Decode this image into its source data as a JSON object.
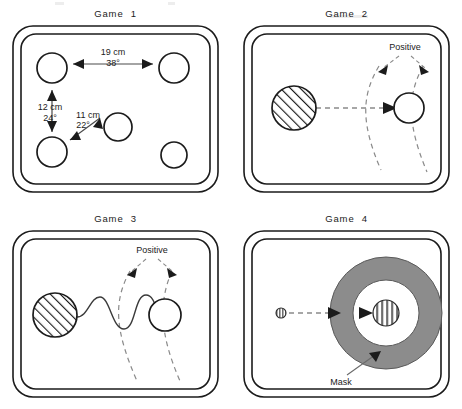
{
  "figure": {
    "name": "four-game-apparatus-diagram",
    "background_color": "#ffffff",
    "line_color": "#1b1b1b",
    "dashed_color": "#7a7a7a",
    "mask_fill_color": "#8c8c8c",
    "panel_count": 4
  },
  "panels": [
    {
      "id": "game-1",
      "title": "Game  1",
      "arena": {
        "shape": "double-rounded-rectangle",
        "outer_inset": 0,
        "inner_inset": 8
      },
      "targets": [
        {
          "name": "circle-top-left",
          "cx": 52,
          "cy": 68,
          "r": 15,
          "fill": "open"
        },
        {
          "name": "circle-top-right",
          "cx": 174,
          "cy": 68,
          "r": 15,
          "fill": "open"
        },
        {
          "name": "circle-bottom-left",
          "cx": 52,
          "cy": 152,
          "r": 15,
          "fill": "open"
        },
        {
          "name": "circle-bottom-right",
          "cx": 174,
          "cy": 155,
          "r": 13,
          "fill": "open"
        },
        {
          "name": "circle-center",
          "cx": 118,
          "cy": 127,
          "r": 14,
          "fill": "open"
        }
      ],
      "measurements": [
        {
          "name": "measure-top-horizontal",
          "distance": "19 cm",
          "angle": "38°"
        },
        {
          "name": "measure-left-vertical",
          "distance": "12 cm",
          "angle": "24°"
        },
        {
          "name": "measure-diagonal",
          "distance": "11 cm",
          "angle": "22°"
        }
      ]
    },
    {
      "id": "game-2",
      "title": "Game  2",
      "arena": {
        "shape": "double-rounded-rectangle",
        "outer_inset": 0,
        "inner_inset": 8
      },
      "stimulus": {
        "name": "hatched-disc",
        "cx": 63,
        "cy": 108,
        "r": 22,
        "fill": "diagonal-hatch"
      },
      "target": {
        "name": "open-circle",
        "cx": 178,
        "cy": 108,
        "r": 15,
        "fill": "open"
      },
      "path": {
        "name": "straight-dashed-path",
        "style": "dashed",
        "arrowhead": true
      },
      "arcs": {
        "name": "positive-boundary-arcs",
        "count": 2,
        "style": "dashed"
      },
      "label": {
        "name": "positive-label",
        "text": "Positive"
      }
    },
    {
      "id": "game-3",
      "title": "Game  3",
      "arena": {
        "shape": "double-rounded-rectangle",
        "outer_inset": 0,
        "inner_inset": 8
      },
      "stimulus": {
        "name": "hatched-disc",
        "cx": 55,
        "cy": 110,
        "r": 22,
        "fill": "diagonal-hatch"
      },
      "target": {
        "name": "open-circle",
        "cx": 165,
        "cy": 110,
        "r": 16,
        "fill": "open"
      },
      "path": {
        "name": "wavy-solid-path",
        "style": "solid",
        "oscillations": 2.5,
        "arrowhead": false
      },
      "arcs": {
        "name": "positive-boundary-arcs",
        "count": 2,
        "style": "dashed"
      },
      "label": {
        "name": "positive-label",
        "text": "Positive"
      }
    },
    {
      "id": "game-4",
      "title": "Game  4",
      "arena": {
        "shape": "double-rounded-rectangle",
        "outer_inset": 0,
        "inner_inset": 8
      },
      "stimulus": {
        "name": "small-striped-disc",
        "cx": 50,
        "cy": 108,
        "r": 5,
        "fill": "vertical-stripes"
      },
      "target": {
        "name": "center-striped-disc",
        "cx": 155,
        "cy": 108,
        "r": 13,
        "fill": "vertical-stripes"
      },
      "mask": {
        "name": "mask-annulus",
        "cx": 155,
        "cy": 108,
        "outer_r": 56,
        "inner_r": 33,
        "fill": "#8c8c8c"
      },
      "path": {
        "name": "straight-dashed-path",
        "style": "dashed",
        "arrowhead": true
      },
      "inner_path": {
        "name": "short-arrow-to-target",
        "style": "solid",
        "arrowhead": true
      },
      "label": {
        "name": "mask-label",
        "text": "Mask"
      }
    }
  ]
}
